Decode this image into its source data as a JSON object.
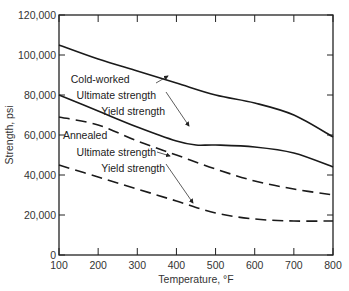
{
  "chart_data": {
    "type": "line",
    "title": "",
    "xlabel": "Temperature, °F",
    "ylabel": "Strength, psi",
    "xlim": [
      100,
      800
    ],
    "ylim": [
      0,
      120000
    ],
    "grid": false,
    "legend": "inline annotations",
    "x_ticks": [
      "100",
      "200",
      "300",
      "400",
      "500",
      "600",
      "700",
      "800"
    ],
    "y_ticks": [
      "0",
      "20,000",
      "40,000",
      "60,000",
      "80,000",
      "100,000",
      "120,000"
    ],
    "series": [
      {
        "name": "Cold-worked Ultimate strength",
        "style": "solid",
        "x": [
          100,
          200,
          300,
          400,
          500,
          600,
          700,
          800
        ],
        "values": [
          105000,
          98000,
          92000,
          86000,
          80000,
          76000,
          70000,
          59000
        ]
      },
      {
        "name": "Cold-worked Yield strength",
        "style": "solid",
        "x": [
          100,
          200,
          300,
          400,
          450,
          500,
          600,
          700,
          800
        ],
        "values": [
          80000,
          72000,
          64000,
          57000,
          55000,
          55000,
          54000,
          51000,
          44000
        ]
      },
      {
        "name": "Annealed Ultimate strength",
        "style": "dashed",
        "x": [
          100,
          200,
          300,
          400,
          500,
          600,
          700,
          800
        ],
        "values": [
          69000,
          65000,
          57000,
          50000,
          43000,
          37000,
          33000,
          30000
        ]
      },
      {
        "name": "Annealed Yield strength",
        "style": "dashed",
        "x": [
          100,
          200,
          300,
          400,
          500,
          600,
          700,
          800
        ],
        "values": [
          45000,
          39000,
          33000,
          27000,
          21000,
          18000,
          17000,
          17000
        ]
      }
    ],
    "annotations": [
      {
        "text": "Cold-worked",
        "x": 130,
        "y": 86000
      },
      {
        "text": "Ultimate strength",
        "x": 145,
        "y": 78000
      },
      {
        "text": "Yield strength",
        "x": 208,
        "y": 70000
      },
      {
        "text": "Annealed",
        "x": 110,
        "y": 58000
      },
      {
        "text": "Ultimate strength",
        "x": 145,
        "y": 49500
      },
      {
        "text": "Yield strength",
        "x": 208,
        "y": 41500
      }
    ]
  }
}
